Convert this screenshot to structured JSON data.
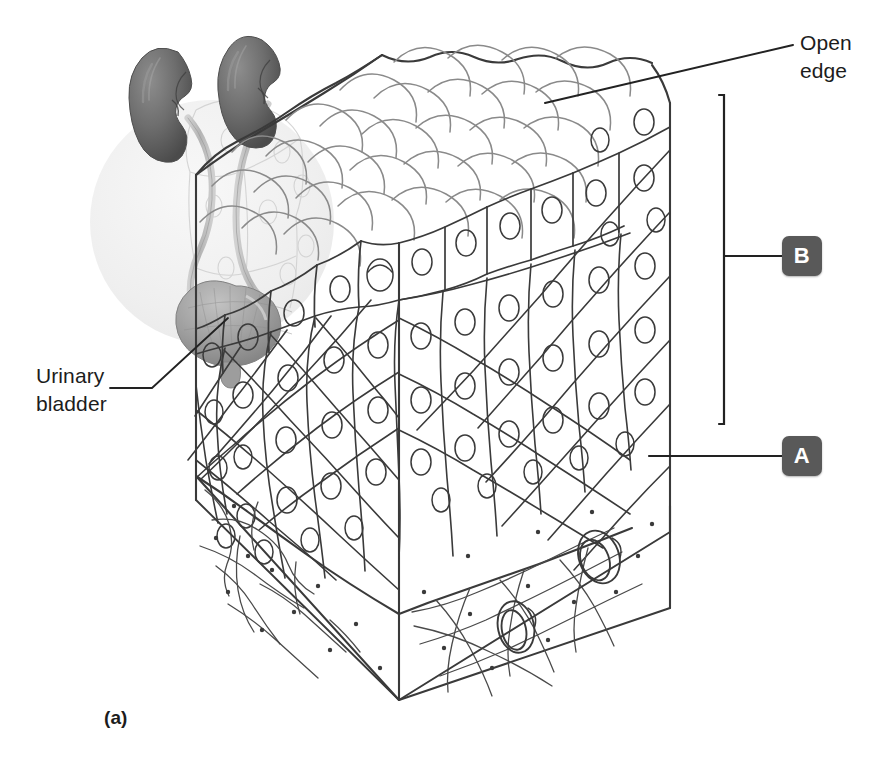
{
  "figure": {
    "panel_label": "(a)",
    "background_color": "#ffffff",
    "ink_color": "#2b2b2b"
  },
  "labels": {
    "open_edge": "Open\nedge",
    "urinary_bladder": "Urinary\nbladder"
  },
  "keys": [
    {
      "id": "B",
      "letter": "B",
      "box_color": "#595959",
      "text_color": "#ffffff",
      "points_to": "epithelium-layer"
    },
    {
      "id": "A",
      "letter": "A",
      "box_color": "#595959",
      "text_color": "#ffffff",
      "points_to": "connective-tissue-layer"
    }
  ],
  "inset": {
    "name": "urinary-system-inset",
    "circle_fill": "#f1f1f1",
    "ring_color": "#ffffff",
    "organs": [
      {
        "name": "kidney-left",
        "color": "#6e6e6e"
      },
      {
        "name": "kidney-right",
        "color": "#6e6e6e"
      },
      {
        "name": "ureter-left",
        "color": "#bdbdbd"
      },
      {
        "name": "ureter-right",
        "color": "#bdbdbd"
      },
      {
        "name": "urinary-bladder",
        "color": "#9a9a9a"
      },
      {
        "name": "urethra",
        "color": "#9a9a9a"
      }
    ]
  },
  "tissue_block": {
    "name": "tissue-block",
    "layers": [
      {
        "name": "umbrella-cell-surface",
        "description": "domed apical cells on top face"
      },
      {
        "name": "epithelium-layer",
        "key": "B"
      },
      {
        "name": "connective-tissue-layer",
        "key": "A"
      }
    ],
    "features": [
      {
        "name": "blood-vessel-upper",
        "count": 1
      },
      {
        "name": "blood-vessel-lower",
        "count": 1
      },
      {
        "name": "collagen-fibers"
      },
      {
        "name": "fibroblast-nuclei"
      }
    ]
  }
}
